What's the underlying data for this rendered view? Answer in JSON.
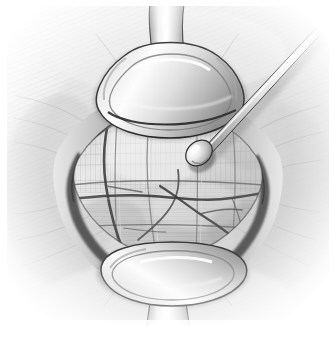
{
  "figure": {
    "medium": "grayscale pen-and-ink / airbrush medical illustration",
    "caption": "Operative field exposed between two self-retaining retractor blades; a blunt ball-tipped probe enters from the upper right and rests on the exposed muscle/fascial surface, which is crossed by vessels.",
    "background_color": "#ffffff",
    "canvas": {
      "width": 336,
      "height": 338
    },
    "plate_bounds": {
      "x": 6,
      "y": 4,
      "width": 324,
      "height": 322
    }
  },
  "palette": {
    "paper_white": "#ffffff",
    "skin_highlight": "#f2f2f2",
    "skin_midtone": "#d8d8d8",
    "skin_shadow": "#a8a8a8",
    "wound_shadow": "#2d2d2d",
    "wound_deep_black": "#111111",
    "tissue_light": "#dedede",
    "tissue_mid": "#b6b6b6",
    "tissue_dark": "#7e7e7e",
    "vessel_dark": "#3a3a3a",
    "metal_highlight": "#fbfbfb",
    "metal_midtone": "#c9c9c9",
    "metal_shadow": "#8c8c8c",
    "outline": "#1c1c1c"
  },
  "anatomy": {
    "field_label": "exposed muscle and fascia",
    "fiber_direction": "vertical striations in upper field, horizontal bands in lower field",
    "structures": [
      {
        "name": "skin-and-subcutaneous-margin",
        "position": "surrounding the incision"
      },
      {
        "name": "wound-edge-left",
        "position": "left border of the incision"
      },
      {
        "name": "wound-edge-right",
        "position": "right border of the incision"
      },
      {
        "name": "exposed-muscle-belly",
        "position": "center of the field"
      },
      {
        "name": "transverse-vessel",
        "position": "crossing the field horizontally at mid height"
      },
      {
        "name": "longitudinal-vessel",
        "position": "running vertically in the left third of the field"
      },
      {
        "name": "branching-vessel",
        "position": "arching through the lower-right of the field"
      }
    ]
  },
  "instruments": [
    {
      "name": "retractor-blade-superior",
      "label": "Superior retractor blade",
      "location": "top of the incision",
      "description": "broad curved blade with narrow stem leaving the top of the frame"
    },
    {
      "name": "retractor-blade-inferior",
      "label": "Inferior retractor blade",
      "location": "bottom of the incision",
      "description": "mirror-image blade with narrow stem leaving the bottom of the frame"
    },
    {
      "name": "ball-tip-probe",
      "label": "Ball-tipped probe / dissector",
      "location": "entering from the upper right corner",
      "description": "slim straight shaft ending in a rounded olive tip resting on the tissue"
    }
  ],
  "annotations": {
    "leader_lines": [],
    "labels": [],
    "figure_number": ""
  }
}
